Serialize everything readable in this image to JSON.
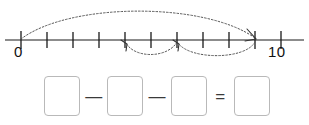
{
  "numberline": {
    "start_label": "0",
    "end_label": "10",
    "min": 0,
    "max": 10,
    "tick_values": [
      0,
      1,
      2,
      3,
      4,
      5,
      6,
      7,
      8,
      9,
      10
    ],
    "axis_color": "#1a1a1a",
    "arc_color": "#555555"
  },
  "jumps": [
    {
      "name": "jump-total",
      "from": 0,
      "to": 9,
      "direction": "right",
      "position": "above",
      "arrowhead": true
    },
    {
      "name": "jump-second",
      "from": 6,
      "to": 4,
      "direction": "left",
      "position": "below",
      "arrowhead": true
    },
    {
      "name": "jump-first",
      "from": 9,
      "to": 6,
      "direction": "left",
      "position": "below",
      "arrowhead": true
    }
  ],
  "equation": {
    "boxes": [
      "",
      "",
      "",
      ""
    ],
    "operators": [
      "—",
      "—",
      "="
    ],
    "box_border_color": "#b9b9b9"
  }
}
